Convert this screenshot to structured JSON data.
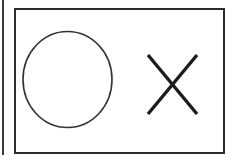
{
  "scene": {
    "title": "Circle and cross shape panel",
    "width": 233,
    "height": 161,
    "background_color": "#ffffff",
    "ink_color": "#262626",
    "edge_line_color": "#3a3a3a",
    "description": "Scanned line drawing: a rectangular frame containing a hand-drawn circle on the left and an X mark on the right"
  },
  "frame": {
    "name": "outer rectangle frame",
    "stroke_color": "#2d2d2d",
    "stroke_width": 2,
    "x": 15,
    "y": 9,
    "width": 209,
    "height": 144,
    "fill": "none"
  },
  "left_edge_line": {
    "name": "partial left border line of adjacent panel",
    "stroke_color": "#3a3a3a",
    "stroke_width": 2,
    "x": 3,
    "y_top": 0,
    "y_bottom": 155
  },
  "shapes": [
    {
      "id": "circle-shape",
      "symbol": "O",
      "label": "circle",
      "type": "ellipse",
      "center_x": 67.5,
      "center_y": 79.5,
      "radius_x": 44.5,
      "radius_y": 48,
      "stroke_color": "#333333",
      "stroke_width": 1.6,
      "fill": "none"
    },
    {
      "id": "cross-shape",
      "symbol": "X",
      "label": "cross",
      "type": "x-mark",
      "left": 148,
      "top": 55,
      "right": 197,
      "bottom": 114,
      "stroke_color": "#1c1c1c",
      "stroke_width": 3.4,
      "fill": "none"
    }
  ],
  "legend": {
    "circle_meaning": "O",
    "cross_meaning": "X"
  }
}
